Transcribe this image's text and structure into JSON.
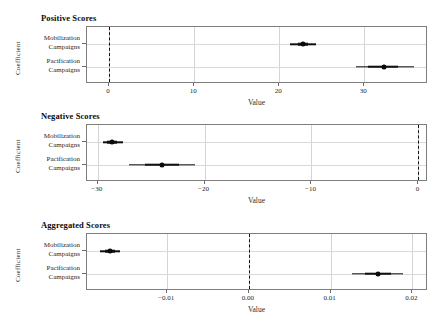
{
  "figure": {
    "width": 447,
    "height": 322,
    "background": "#ffffff",
    "point_color": "#0a0a0a",
    "grid_color": "#d4d4d4",
    "axis_color": "#7d7d7d",
    "zero_line_color": "#111111"
  },
  "chart_data": [
    {
      "type": "scatter",
      "title": "Positive Scores",
      "xlabel": "Value",
      "ylabel": "Coefficient",
      "grid": true,
      "legend": "none",
      "orientation": "horizontal-errorbar",
      "xlim": [
        -2.6,
        37.5
      ],
      "xticks": [
        0,
        10,
        20,
        30
      ],
      "xtick_labels": [
        "0",
        "10",
        "20",
        "30"
      ],
      "reference_line": 0,
      "reference_line_style": "dashed",
      "categories": [
        "Mobilization Campaigns",
        "Pacification Campaigns"
      ],
      "points": [
        {
          "category": "Mobilization Campaigns",
          "estimate": 22.8,
          "ci_low": 21.3,
          "ci_high": 24.3,
          "ci_inner_low": 22.2,
          "ci_inner_high": 23.4
        },
        {
          "category": "Pacification Campaigns",
          "estimate": 32.3,
          "ci_low": 29.0,
          "ci_high": 35.8,
          "ci_inner_low": 30.5,
          "ci_inner_high": 34.0
        }
      ]
    },
    {
      "type": "scatter",
      "title": "Negative Scores",
      "xlabel": "Value",
      "ylabel": "Coefficient",
      "grid": true,
      "legend": "none",
      "orientation": "horizontal-errorbar",
      "xlim": [
        -31.0,
        0.9
      ],
      "xticks": [
        -30,
        -20,
        -10,
        0
      ],
      "xtick_labels": [
        "−30",
        "−20",
        "−10",
        "0"
      ],
      "reference_line": 0,
      "reference_line_style": "dashed",
      "categories": [
        "Mobilization Campaigns",
        "Pacification Campaigns"
      ],
      "points": [
        {
          "category": "Mobilization Campaigns",
          "estimate": -28.7,
          "ci_low": -29.5,
          "ci_high": -27.6,
          "ci_inner_low": -29.1,
          "ci_inner_high": -28.2
        },
        {
          "category": "Pacification Campaigns",
          "estimate": -24.0,
          "ci_low": -27.1,
          "ci_high": -20.9,
          "ci_inner_low": -25.6,
          "ci_inner_high": -22.4
        }
      ]
    },
    {
      "type": "scatter",
      "title": "Aggregated Scores",
      "xlabel": "Value",
      "ylabel": "Coefficient",
      "grid": true,
      "legend": "none",
      "orientation": "horizontal-errorbar",
      "xlim": [
        -0.0198,
        0.0219
      ],
      "xticks": [
        -0.01,
        0.0,
        0.01,
        0.02
      ],
      "xtick_labels": [
        "−0.01",
        "0.00",
        "0.01",
        "0.02"
      ],
      "reference_line": 0,
      "reference_line_style": "dashed",
      "categories": [
        "Mobilization Campaigns",
        "Pacification Campaigns"
      ],
      "points": [
        {
          "category": "Mobilization Campaigns",
          "estimate": -0.017,
          "ci_low": -0.0182,
          "ci_high": -0.0158,
          "ci_inner_low": -0.0176,
          "ci_inner_high": -0.0164
        },
        {
          "category": "Pacification Campaigns",
          "estimate": 0.0158,
          "ci_low": 0.0126,
          "ci_high": 0.0189,
          "ci_inner_low": 0.0142,
          "ci_inner_high": 0.0174
        }
      ]
    }
  ],
  "panels": [
    {
      "title": "Positive Scores",
      "ylabel": "Coefficient",
      "xlabel": "Value",
      "ytick_lines": [
        [
          "Mobilization",
          "Campaigns"
        ],
        [
          "Pacification",
          "Campaigns"
        ]
      ]
    },
    {
      "title": "Negative Scores",
      "ylabel": "Coefficient",
      "xlabel": "Value",
      "ytick_lines": [
        [
          "Mobilization",
          "Campaigns"
        ],
        [
          "Pacification",
          "Campaigns"
        ]
      ]
    },
    {
      "title": "Aggregated Scores",
      "ylabel": "Coefficient",
      "xlabel": "Value",
      "ytick_lines": [
        [
          "Mobilization",
          "Campaigns"
        ],
        [
          "Pacification",
          "Campaigns"
        ]
      ]
    }
  ]
}
